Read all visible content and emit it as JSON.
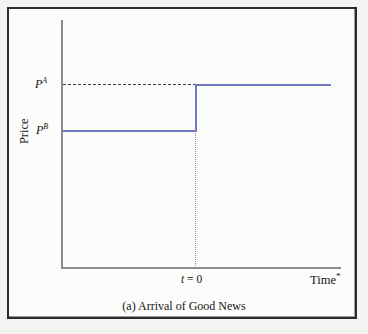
{
  "figure": {
    "caption": "(a) Arrival of Good News",
    "ylabel": "Price",
    "xlabel": "Time",
    "xlabel_marker": "*",
    "event_label_symbol": "t",
    "event_label_rest": " = 0",
    "level_high_base": "P",
    "level_high_sup": "A",
    "level_low_base": "P",
    "level_low_sup": "B"
  },
  "colors": {
    "series": "#6f79c4",
    "axis": "#8c8c8c",
    "dashed_reference": "#3a3a50",
    "dotted_event": "#8a8a9a",
    "frame": "#2b2b2b",
    "background": "#fcfcfa",
    "page_background": "#f3f3f1",
    "text": "#171717"
  },
  "chart_data": {
    "type": "line",
    "title": "(a) Arrival of Good News",
    "xlabel": "Time*",
    "ylabel": "Price",
    "x": [
      -1.0,
      0.0,
      0.0,
      1.0
    ],
    "values": [
      1.0,
      1.0,
      2.0,
      2.0
    ],
    "series": [
      {
        "name": "Price path",
        "x": [
          -1.0,
          0.0,
          0.0,
          1.0
        ],
        "values": [
          1.0,
          1.0,
          2.0,
          2.0
        ],
        "style": "step",
        "color": "#6f79c4"
      }
    ],
    "annotations": [
      {
        "name": "P^A",
        "text": "P A",
        "type": "y-level-label",
        "y": 2.0,
        "line": "dashed",
        "description": "Post-news price level, dashed horizontal reference from y-axis to t = 0"
      },
      {
        "name": "P^B",
        "text": "P B",
        "type": "y-level-label",
        "y": 1.0,
        "line": "solid",
        "description": "Pre-news price level"
      },
      {
        "name": "t = 0",
        "text": "t = 0",
        "type": "x-event-label",
        "x": 0.0,
        "line": "dotted",
        "description": "Vertical dotted line marking news arrival at t = 0"
      }
    ],
    "ytick_labels": [
      "P B",
      "P A"
    ],
    "ytick_values": [
      1.0,
      2.0
    ],
    "xtick_labels": [
      "t = 0"
    ],
    "xtick_values": [
      0.0
    ],
    "ylim": [
      0.0,
      2.55
    ],
    "xlim": [
      -1.05,
      1.15
    ],
    "grid": false,
    "legend": false,
    "legend_position": "none"
  }
}
